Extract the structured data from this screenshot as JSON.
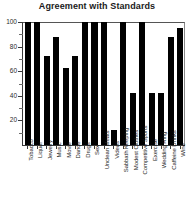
{
  "chart_data": {
    "type": "bar",
    "title": "Agreement with Standards",
    "xlabel": "",
    "ylabel": "",
    "ylim": [
      0,
      100
    ],
    "yticks": [
      0,
      20,
      40,
      60,
      80,
      100
    ],
    "ytick_labels": [
      "",
      "20",
      "40",
      "60",
      "80",
      "100"
    ],
    "grid": false,
    "legend": "none",
    "bar_color": "#000000",
    "categories": [
      "Tobacco",
      "Liquor",
      "Jewelry",
      "Music",
      "Movie",
      "Dance",
      "Drugs",
      "Sex",
      "Unclean Meats",
      "Videos",
      "Sabbath Keeping",
      "Modest Clothes",
      "Competitive Sports",
      "Exercise",
      "Wedding Ring",
      "Caffeine Drinks",
      "Wine"
    ],
    "values": [
      100,
      100,
      72,
      88,
      63,
      72,
      100,
      100,
      100,
      12,
      100,
      42,
      100,
      42,
      42,
      88,
      95
    ]
  },
  "axis": {
    "y_labels": [
      "100",
      "80",
      "60",
      "40",
      "20"
    ]
  }
}
